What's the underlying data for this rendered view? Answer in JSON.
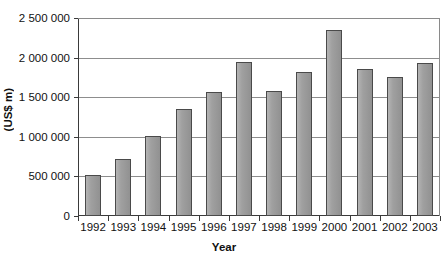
{
  "chart_data": {
    "type": "bar",
    "title": "",
    "xlabel": "Year",
    "ylabel": "(US$ m)",
    "categories": [
      "1992",
      "1993",
      "1994",
      "1995",
      "1996",
      "1997",
      "1998",
      "1999",
      "2000",
      "2001",
      "2002",
      "2003"
    ],
    "values": [
      520000,
      720000,
      1010000,
      1350000,
      1570000,
      1940000,
      1580000,
      1820000,
      2350000,
      1850000,
      1760000,
      1930000
    ],
    "ylim": [
      0,
      2500000
    ],
    "ytick_values": [
      0,
      500000,
      1000000,
      1500000,
      2000000,
      2500000
    ],
    "ytick_labels": [
      "0",
      "500 000",
      "1 000 000",
      "1 500 000",
      "2 000 000",
      "2 500 000"
    ],
    "grid": true,
    "legend": "none",
    "bar_color": "#9d9d9d",
    "bar_border_color": "#4a4a4a",
    "grid_color": "#8d8d8d",
    "axis_color": "#3a3a3a",
    "background": "#ffffff"
  }
}
